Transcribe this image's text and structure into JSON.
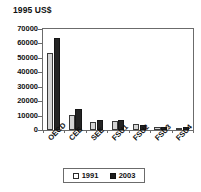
{
  "chart_data": {
    "type": "bar",
    "title": "1995 US$",
    "xlabel": "",
    "ylabel": "",
    "ylim": [
      0,
      70000
    ],
    "ytick_labels": [
      "70000",
      "60000",
      "50000",
      "40000",
      "30000",
      "20000",
      "10000",
      "0"
    ],
    "yticks": [
      70000,
      60000,
      50000,
      40000,
      30000,
      20000,
      10000,
      0
    ],
    "grid": false,
    "legend_position": "bottom",
    "categories": [
      "OECD",
      "CEE",
      "SEE",
      "FSU1",
      "FSU2",
      "FSU3",
      "FSU4"
    ],
    "series": [
      {
        "name": "1991",
        "color": "#d5d5d5",
        "values": [
          53500,
          10300,
          5300,
          6300,
          4400,
          1900,
          1600
        ]
      },
      {
        "name": "2003",
        "color": "#242424",
        "values": [
          64000,
          14700,
          7000,
          7200,
          3700,
          2100,
          2200
        ]
      }
    ]
  },
  "legend": {
    "entries": [
      {
        "label": "1991",
        "swatch": "open-square-icon"
      },
      {
        "label": "2003",
        "swatch": "filled-square-icon"
      }
    ]
  }
}
